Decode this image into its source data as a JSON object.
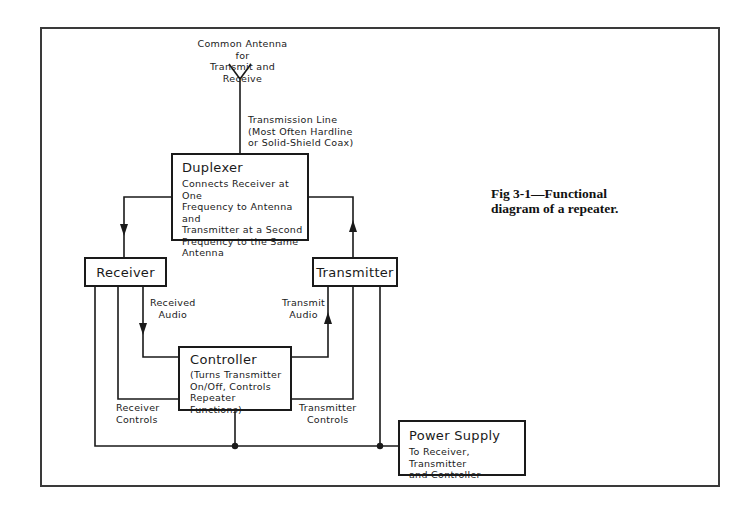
{
  "figure": {
    "caption_line1": "Fig 3-1—Functional",
    "caption_line2": "diagram of a repeater."
  },
  "antenna": {
    "label_line1": "Common Antenna for",
    "label_line2": "Transmit and Receive"
  },
  "transmission_line": {
    "label_line1": "Transmission Line",
    "label_line2": "(Most Often Hardline",
    "label_line3": "or Solid-Shield Coax)"
  },
  "blocks": {
    "duplexer": {
      "title": "Duplexer",
      "desc_line1": "Connects Receiver at One",
      "desc_line2": "Frequency to Antenna and",
      "desc_line3": "Transmitter at a Second",
      "desc_line4": "Frequency to the Same",
      "desc_line5": "Antenna"
    },
    "receiver": {
      "title": "Receiver"
    },
    "transmitter": {
      "title": "Transmitter"
    },
    "controller": {
      "title": "Controller",
      "desc_line1": "(Turns Transmitter",
      "desc_line2": "On/Off, Controls",
      "desc_line3": "Repeater Functions)"
    },
    "power_supply": {
      "title": "Power Supply",
      "desc_line1": "To Receiver, Transmitter",
      "desc_line2": "and Controller"
    }
  },
  "signals": {
    "received_audio_line1": "Received",
    "received_audio_line2": "Audio",
    "transmit_audio_line1": "Transmit",
    "transmit_audio_line2": "Audio",
    "receiver_controls_line1": "Receiver",
    "receiver_controls_line2": "Controls",
    "transmitter_controls_line1": "Transmitter",
    "transmitter_controls_line2": "Controls"
  },
  "colors": {
    "line": "#1a1a1a",
    "frame": "#3a3a3a",
    "background": "#ffffff"
  }
}
